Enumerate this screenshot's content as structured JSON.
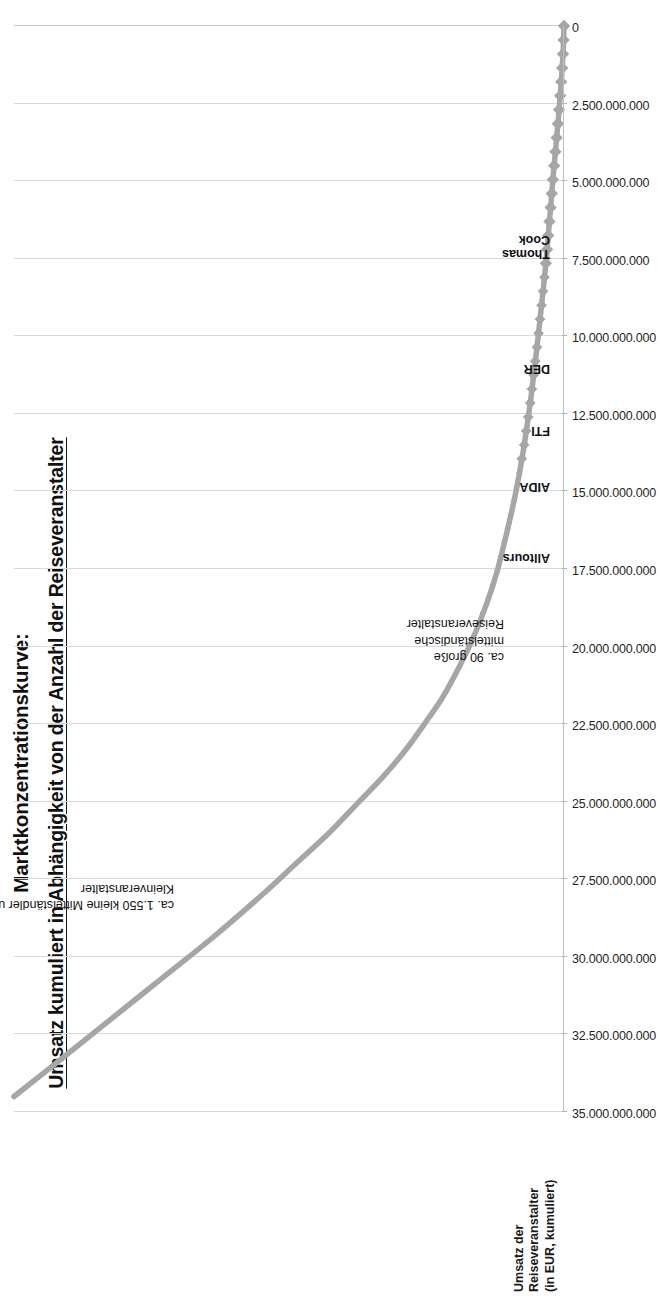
{
  "title": {
    "line1": "Marktkonzentrationskurve:",
    "line2": "Umsatz kumuliert in Abhängigkeit von der Anzahl der Reiseveranstalter"
  },
  "axis_title": {
    "line1": "Umsatz der",
    "line2": "Reiseveranstalter",
    "line3": "(in EUR, kumuliert)"
  },
  "annotations": {
    "small": {
      "line1": "ca. 1.550 kleine Mittelständler und",
      "line2": "Kleinveranstalter"
    },
    "medium": {
      "line1": "ca. 90 große",
      "line2": "mittelständische",
      "line3": "Reiseveranstalter"
    }
  },
  "point_labels": [
    {
      "name": "Alltours",
      "lines": [
        "Alltours"
      ]
    },
    {
      "name": "AIDA",
      "lines": [
        "AIDA"
      ]
    },
    {
      "name": "FTI",
      "lines": [
        "FTI"
      ]
    },
    {
      "name": "DER",
      "lines": [
        "DER"
      ]
    },
    {
      "name": "Thomas Cook",
      "lines": [
        "Thomas",
        "Cook"
      ]
    }
  ],
  "colors": {
    "curve": "#a6a6a6",
    "grid": "#d9d9d9",
    "axis": "#bfbfbf",
    "text": "#111111"
  },
  "chart_data": {
    "type": "line",
    "title": "Marktkonzentrationskurve: Umsatz kumuliert in Abhängigkeit von der Anzahl der Reiseveranstalter",
    "xlabel": "",
    "ylabel": "Umsatz der Reiseveranstalter (in EUR, kumuliert)",
    "orientation": "rotated-90",
    "grid": true,
    "legend": "none",
    "ylim": [
      0,
      35000000000
    ],
    "ytick_labels": [
      "35.000.000.000",
      "32.500.000.000",
      "30.000.000.000",
      "27.500.000.000",
      "25.000.000.000",
      "22.500.000.000",
      "20.000.000.000",
      "17.500.000.000",
      "15.000.000.000",
      "12.500.000.000",
      "10.000.000.000",
      "7.500.000.000",
      "5.000.000.000",
      "2.500.000.000",
      "0"
    ],
    "ytick_values": [
      35000000000,
      32500000000,
      30000000000,
      27500000000,
      25000000000,
      22500000000,
      20000000000,
      17500000000,
      15000000000,
      12500000000,
      10000000000,
      7500000000,
      5000000000,
      2500000000,
      0
    ],
    "x_description": "Anzahl der Reiseveranstalter (kumuliert, absteigend nach Umsatz sortiert)",
    "x_range_firms": [
      1,
      1640
    ],
    "series": [
      {
        "name": "Umsatz kumuliert",
        "x": [
          1640,
          1500,
          1350,
          1200,
          1050,
          900,
          800,
          700,
          620,
          540,
          470,
          410,
          360,
          310,
          270,
          230,
          200,
          170,
          145,
          120,
          100,
          90,
          80,
          70,
          60,
          52,
          45,
          38,
          32,
          26,
          21,
          17,
          14,
          11,
          9,
          7,
          6,
          5,
          4,
          3,
          2,
          1,
          0
        ],
        "y": [
          34500000000,
          33300000000,
          32000000000,
          30700000000,
          29400000000,
          28000000000,
          27000000000,
          26000000000,
          25100000000,
          24200000000,
          23300000000,
          22400000000,
          21600000000,
          20600000000,
          19700000000,
          18600000000,
          17600000000,
          16300000000,
          15100000000,
          13600000000,
          12100000000,
          11200000000,
          10300000000,
          9300000000,
          8300000000,
          7400000000,
          6500000000,
          5600000000,
          4800000000,
          4100000000,
          3500000000,
          3000000000,
          2600000000,
          2200000000,
          1900000000,
          1600000000,
          1450000000,
          1280000000,
          1100000000,
          900000000,
          680000000,
          400000000,
          0
        ]
      }
    ],
    "marked_points": [
      {
        "label": "Alltours",
        "cumulative_revenue": 17500000000
      },
      {
        "label": "AIDA",
        "cumulative_revenue": 15200000000
      },
      {
        "label": "FTI",
        "cumulative_revenue": 13400000000
      },
      {
        "label": "DER",
        "cumulative_revenue": 11400000000
      },
      {
        "label": "Thomas Cook",
        "cumulative_revenue": 7700000000
      }
    ],
    "annotations": [
      {
        "text": "ca. 1.550 kleine Mittelständler und Kleinveranstalter",
        "region": "left tail, high firm count"
      },
      {
        "text": "ca. 90 große mittelständische Reiseveranstalter",
        "region": "mid curve"
      }
    ]
  }
}
